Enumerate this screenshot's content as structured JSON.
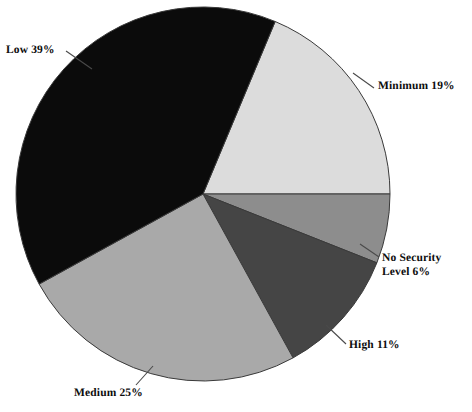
{
  "chart_data": {
    "type": "pie",
    "title": "",
    "categories": [
      "Low",
      "Minimum",
      "No Security Level",
      "High",
      "Medium"
    ],
    "values": [
      39,
      19,
      6,
      11,
      25
    ],
    "value_unit": "%",
    "legend": "none",
    "grid": false,
    "start_angle_deg": 22.7,
    "direction": "clockwise",
    "slices": [
      {
        "name": "minimum",
        "label": "Minimum 19%",
        "category": "Minimum",
        "value": 19,
        "color": "#dcdcdc",
        "start_deg": 22.7,
        "end_deg": 90.0
      },
      {
        "name": "no-security-level",
        "label_line1": "No Security",
        "label_line2": "Level 6%",
        "category": "No Security Level",
        "value": 6,
        "color": "#8d8d8d",
        "start_deg": 90.0,
        "end_deg": 111.6
      },
      {
        "name": "high",
        "label": "High 11%",
        "category": "High",
        "value": 11,
        "color": "#454545",
        "start_deg": 111.6,
        "end_deg": 151.2
      },
      {
        "name": "medium",
        "label": "Medium 25%",
        "category": "Medium",
        "value": 25,
        "color": "#a9a9a9",
        "start_deg": 151.2,
        "end_deg": 241.2
      },
      {
        "name": "low",
        "label": "Low 39%",
        "category": "Low",
        "value": 39,
        "color": "#0b0b0b",
        "start_deg": 241.2,
        "end_deg": 382.7
      }
    ],
    "labels": {
      "low": "Low 39%",
      "minimum": "Minimum 19%",
      "no_security_line1": "No Security",
      "no_security_line2": "Level 6%",
      "high": "High 11%",
      "medium": "Medium 25%"
    },
    "geometry": {
      "center_x": 203,
      "center_y": 194,
      "radius": 187
    },
    "colors": {
      "background": "#ffffff",
      "outline": "#3a3a3a",
      "text": "#0d0d0d"
    }
  }
}
